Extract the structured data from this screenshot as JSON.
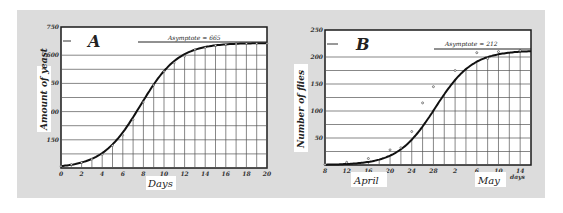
{
  "chart_data": [
    {
      "type": "line",
      "panel_label": "A",
      "title": "",
      "xlabel": "Days",
      "ylabel": "Amount of yeast",
      "annotation": "Asymptote = 665",
      "asymptote": 665,
      "xlim": [
        0,
        20
      ],
      "ylim": [
        0,
        750
      ],
      "x_ticks": [
        "0",
        "2",
        "4",
        "6",
        "8",
        "10",
        "12",
        "14",
        "16",
        "18",
        "20"
      ],
      "y_ticks": [
        "150",
        "300",
        "450",
        "600",
        "750"
      ],
      "grid": true,
      "x": [
        0,
        1,
        2,
        3,
        4,
        5,
        6,
        7,
        8,
        9,
        10,
        11,
        12,
        13,
        14,
        15,
        16,
        17,
        18,
        19,
        20
      ],
      "values": [
        9.6,
        18.3,
        29.0,
        47.2,
        71.1,
        119.1,
        174.6,
        257.3,
        350.7,
        441.0,
        513.3,
        559.7,
        594.8,
        629.4,
        640.8,
        651.1,
        655.9,
        659.6,
        661.8,
        662.5,
        663.0
      ]
    },
    {
      "type": "line",
      "panel_label": "B",
      "title": "",
      "xlabel": "April / May",
      "ylabel": "Number of flies",
      "annotation": "Asymptote = 212",
      "asymptote": 212,
      "xlim": [
        0,
        40
      ],
      "ylim": [
        0,
        250
      ],
      "x_ticks": [
        "8",
        "12",
        "16",
        "20",
        "24",
        "28",
        "2",
        "6",
        "10",
        "14"
      ],
      "x_tick_suffix": "days",
      "month_labels": [
        "April",
        "May"
      ],
      "y_ticks": [
        "50",
        "100",
        "150",
        "200",
        "250"
      ],
      "grid": true,
      "x": [
        "Apr 8",
        "Apr 12",
        "Apr 16",
        "Apr 20",
        "Apr 22",
        "Apr 24",
        "Apr 26",
        "Apr 28",
        "May 2",
        "May 6",
        "May 8",
        "May 10",
        "May 14"
      ],
      "values": [
        1,
        5,
        12,
        28,
        32,
        62,
        115,
        145,
        175,
        208,
        197,
        210,
        212
      ],
      "fitted_curve": "logistic, asymptote 212"
    }
  ],
  "charts": {
    "a": {
      "label": "A",
      "ylabel": "Amount of yeast",
      "xlabel": "Days",
      "asymptote_text": "Asymptote = 665",
      "x_ticks": [
        "0",
        "2",
        "4",
        "6",
        "8",
        "10",
        "12",
        "14",
        "16",
        "18",
        "20"
      ],
      "y_ticks": [
        "150",
        "300",
        "450",
        "600",
        "750"
      ]
    },
    "b": {
      "label": "B",
      "ylabel": "Number of flies",
      "asymptote_text": "Asymptote = 212",
      "x_ticks": [
        "8",
        "12",
        "16",
        "20",
        "24",
        "28",
        "2",
        "6",
        "10",
        "14"
      ],
      "y_ticks": [
        "50",
        "100",
        "150",
        "200",
        "250"
      ],
      "month_april": "April",
      "month_may": "May",
      "days_suffix": "days"
    }
  },
  "colors": {
    "panel_bg": "#dcdcdc",
    "plot_bg": "#ffffff",
    "line": "#1a1a1a",
    "grid": "#555555"
  }
}
